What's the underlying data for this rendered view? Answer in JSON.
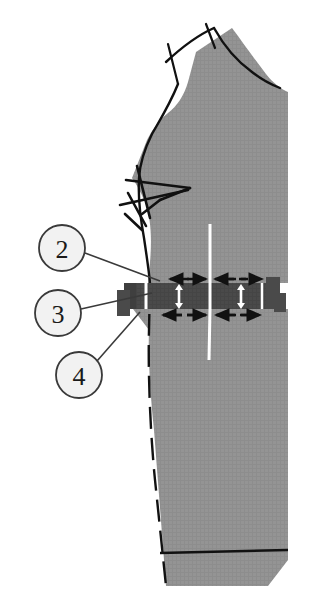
{
  "figure": {
    "kind": "sewing-pattern-diagram",
    "background_color": "#ffffff",
    "fabric_color": "#949494",
    "band_color": "#4a4a4a",
    "line_color": "#111111",
    "grainline_color": "#ffffff",
    "callout_fill": "#f2f2f2",
    "callout_stroke": "#3a3a3a"
  },
  "callouts": [
    {
      "label": "2",
      "cx": 62,
      "cy": 248,
      "r": 23,
      "target_x": 160,
      "target_y": 281
    },
    {
      "label": "3",
      "cx": 58,
      "cy": 313,
      "r": 23,
      "target_x": 152,
      "target_y": 293
    },
    {
      "label": "4",
      "cx": 79,
      "cy": 375,
      "r": 23,
      "target_x": 140,
      "target_y": 312
    }
  ],
  "annotations": {
    "band_label": "spread-band",
    "grainline_label": "grainline",
    "arrow_up_label": "expand-arrow",
    "dashed_label": "slash-line"
  }
}
